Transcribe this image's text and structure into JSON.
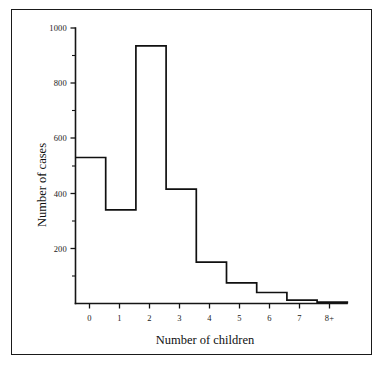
{
  "chart_data": {
    "type": "bar",
    "title": "",
    "subtitle": "",
    "xlabel": "Number of children",
    "ylabel": "Number of cases",
    "categories": [
      "0",
      "1",
      "2",
      "3",
      "4",
      "5",
      "6",
      "7",
      "8+"
    ],
    "values": [
      530,
      340,
      935,
      415,
      150,
      75,
      40,
      12,
      5
    ],
    "series": [
      {
        "name": "Number of cases",
        "values": [
          530,
          340,
          935,
          415,
          150,
          75,
          40,
          12,
          5
        ]
      }
    ],
    "ylim": [
      0,
      1000
    ],
    "xlim": [
      -0.5,
      8.5
    ],
    "y_major_ticks": [
      0,
      200,
      400,
      600,
      800,
      1000
    ],
    "y_major_tick_labels": [
      "",
      "200",
      "400",
      "600",
      "800",
      "1000"
    ],
    "y_minor_ticks": [
      100,
      300,
      500,
      700,
      900
    ],
    "x_tick_labels": [
      "0",
      "1",
      "2",
      "3",
      "4",
      "5",
      "6",
      "7",
      "8+"
    ],
    "grid": false,
    "legend": false,
    "legend_position": "none",
    "style": "step-outline histogram, open bars, black outline on white",
    "colors": {
      "line": "#101010",
      "axis": "#151515",
      "background": "#ffffff",
      "frame": "#1a1a1a"
    }
  },
  "figure": {
    "border_label": "figure-frame"
  }
}
